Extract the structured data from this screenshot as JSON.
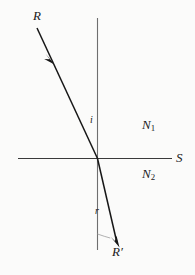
{
  "figure": {
    "background_color": "#fbfbfa",
    "ink_color": "#1a1a1a",
    "faint_ink_color": "#8c8c8c",
    "labels": {
      "incident_ray": "R",
      "refracted_ray": "R",
      "refracted_ray_prime": "′",
      "angle_of_incidence": "i",
      "angle_of_refraction": "r",
      "surface": "S",
      "medium_upper": "N",
      "medium_upper_sub": "1",
      "medium_lower": "N",
      "medium_lower_sub": "2"
    },
    "geometry": {
      "origin_x": 97,
      "origin_y": 158,
      "normal_line": {
        "x": 97,
        "y_top": 18,
        "y_bottom": 250
      },
      "surface_line": {
        "y": 158,
        "x_left": 18,
        "x_right": 172
      },
      "incident_ray": {
        "x1": 37,
        "y1": 28,
        "x2": 97,
        "y2": 158
      },
      "incident_arrow_at": {
        "x": 51,
        "y": 58
      },
      "refracted_ray": {
        "x1": 97,
        "y1": 158,
        "x2": 117,
        "y2": 245
      },
      "angle_arc_radius": 34
    }
  }
}
